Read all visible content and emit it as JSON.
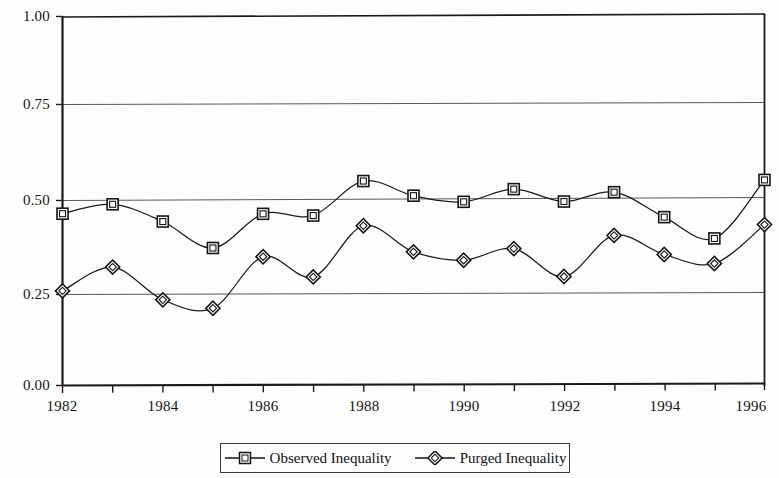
{
  "chart_data": {
    "type": "line",
    "title": "",
    "subtitle": "",
    "xlabel": "",
    "ylabel": "",
    "x": [
      1982,
      1983,
      1984,
      1985,
      1986,
      1987,
      1988,
      1989,
      1990,
      1991,
      1992,
      1993,
      1994,
      1995,
      1996
    ],
    "xlim": [
      1982,
      1996
    ],
    "ylim": [
      0.0,
      1.0
    ],
    "grid": true,
    "gridlines_y": [
      0.25,
      0.5,
      0.75,
      1.0
    ],
    "legend_position": "bottom-center",
    "x_tick_labels": [
      "1982",
      "1984",
      "1986",
      "1988",
      "1990",
      "1992",
      "1994",
      "1996"
    ],
    "x_tick_values": [
      1982,
      1984,
      1986,
      1988,
      1990,
      1992,
      1994,
      1996
    ],
    "y_tick_labels": [
      "0.00",
      "0.25",
      "0.50",
      "0.75",
      "1.00"
    ],
    "y_tick_values": [
      0.0,
      0.25,
      0.5,
      0.75,
      1.0
    ],
    "series": [
      {
        "name": "Observed Inequality",
        "marker": "square",
        "color": "#1a1a1a",
        "values": [
          0.465,
          0.49,
          0.443,
          0.371,
          0.463,
          0.458,
          0.551,
          0.511,
          0.494,
          0.528,
          0.494,
          0.519,
          0.451,
          0.393,
          0.551
        ]
      },
      {
        "name": "Purged Inequality",
        "marker": "diamond",
        "color": "#1a1a1a",
        "values": [
          0.256,
          0.32,
          0.231,
          0.208,
          0.347,
          0.292,
          0.43,
          0.359,
          0.336,
          0.367,
          0.291,
          0.402,
          0.35,
          0.325,
          0.43
        ]
      }
    ]
  },
  "legend": {
    "entries": [
      {
        "label": "Observed Inequality",
        "marker": "square-marker-icon"
      },
      {
        "label": "Purged Inequality",
        "marker": "diamond-marker-icon"
      }
    ]
  },
  "axes": {
    "y_labels": [
      "1.00",
      "0.75",
      "0.50",
      "0.25",
      "0.00"
    ],
    "x_labels": [
      "1982",
      "1984",
      "1986",
      "1988",
      "1990",
      "1992",
      "1994",
      "1996"
    ]
  }
}
